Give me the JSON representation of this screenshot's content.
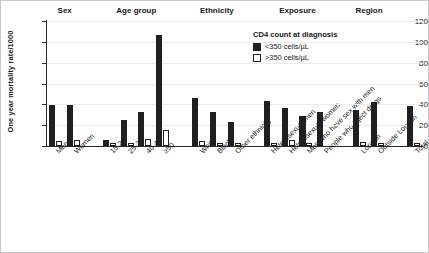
{
  "chart_data": {
    "type": "bar",
    "title": "",
    "xlabel": "",
    "ylabel": "One year mortality rate/1000",
    "ylim": [
      0,
      120
    ],
    "yticks": [
      0,
      20,
      40,
      60,
      80,
      100,
      120
    ],
    "grid": true,
    "legend": {
      "position": "top-right",
      "title": "CD4 count at diagnosis",
      "entries": [
        {
          "label": "<350 cells/µL",
          "color": "#1f1f1f",
          "style": "filled"
        },
        {
          "label": ">350 cells/µL",
          "color": "#ffffff",
          "style": "outline"
        }
      ]
    },
    "group_headers": [
      "Sex",
      "Age group",
      "Ethnicity",
      "Exposure",
      "Region"
    ],
    "groups": [
      {
        "name": "Sex",
        "categories": [
          "Men",
          "Women"
        ]
      },
      {
        "name": "Age group",
        "categories": [
          "15-24",
          "25-39",
          "40-49",
          "≥50"
        ]
      },
      {
        "name": "Ethnicity",
        "categories": [
          "White",
          "Black",
          "Other ethnicity"
        ]
      },
      {
        "name": "Exposure",
        "categories": [
          "Heterosexual men",
          "Heterosexual women",
          "Men who have sex with men",
          "People who inject drugs"
        ]
      },
      {
        "name": "Region",
        "categories": [
          "London",
          "Outside London"
        ]
      },
      {
        "name": "",
        "categories": [
          "Total"
        ]
      }
    ],
    "categories": [
      "Men",
      "Women",
      "15-24",
      "25-39",
      "40-49",
      "≥50",
      "White",
      "Black",
      "Other ethnicity",
      "Heterosexual men",
      "Heterosexual women",
      "Men who have sex with men",
      "People who inject drugs",
      "London",
      "Outside London",
      "Total"
    ],
    "series": [
      {
        "name": "<350 cells/µL",
        "color": "#1f1f1f",
        "values": [
          39.5,
          39.5,
          6,
          25,
          32.5,
          107,
          46,
          33,
          23,
          43.5,
          36.5,
          29,
          32.5,
          34.5,
          42,
          38.5
        ]
      },
      {
        "name": ">350 cells/µL",
        "color": "#ffffff",
        "values": [
          5,
          6,
          3,
          3,
          6.5,
          15,
          5,
          2.5,
          2.5,
          3,
          5.5,
          3,
          0,
          4,
          2.5,
          3
        ]
      }
    ]
  }
}
